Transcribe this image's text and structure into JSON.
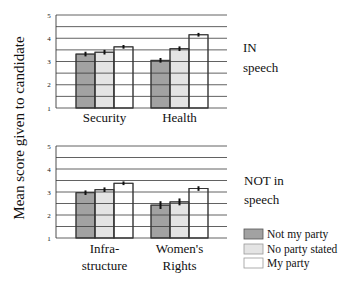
{
  "chart_data": [
    {
      "type": "bar",
      "panel_label": [
        "IN",
        "speech"
      ],
      "categories": [
        "Security",
        "Health"
      ],
      "series": [
        {
          "name": "Not my party",
          "values": [
            3.32,
            3.05
          ],
          "errors": [
            0.1,
            0.1
          ]
        },
        {
          "name": "No party stated",
          "values": [
            3.4,
            3.55
          ],
          "errors": [
            0.1,
            0.1
          ]
        },
        {
          "name": "My party",
          "values": [
            3.63,
            4.15
          ],
          "errors": [
            0.08,
            0.08
          ]
        }
      ],
      "ylim": [
        1,
        5
      ],
      "yticks": [
        1,
        2,
        3,
        4,
        5
      ],
      "grid_step": 0.5,
      "grid": true,
      "error_bars": true
    },
    {
      "type": "bar",
      "panel_label": [
        "NOT in",
        "speech"
      ],
      "categories": [
        "Infra-\nstructure",
        "Women's\nRights"
      ],
      "category_lines": [
        [
          "Infra-",
          "structure"
        ],
        [
          "Women's",
          "Rights"
        ]
      ],
      "series": [
        {
          "name": "Not my party",
          "values": [
            2.97,
            2.43
          ],
          "errors": [
            0.1,
            0.17
          ]
        },
        {
          "name": "No party stated",
          "values": [
            3.1,
            2.57
          ],
          "errors": [
            0.1,
            0.15
          ]
        },
        {
          "name": "My party",
          "values": [
            3.38,
            3.15
          ],
          "errors": [
            0.08,
            0.1
          ]
        }
      ],
      "ylim": [
        1,
        5
      ],
      "yticks": [
        1,
        2,
        3,
        4,
        5
      ],
      "grid_step": 0.5,
      "grid": true,
      "error_bars": true
    }
  ],
  "ylabel": "Mean score given to candidate",
  "legend": {
    "position": "bottom-right",
    "entries": [
      {
        "label": "Not my party",
        "color": "#a2a2a2"
      },
      {
        "label": "No party stated",
        "color": "#e4e4e4"
      },
      {
        "label": "My party",
        "color": "#ffffff"
      }
    ]
  },
  "colors": {
    "grid": "#3a3a3a",
    "bar_edge": "#333333",
    "error": "#111111"
  }
}
